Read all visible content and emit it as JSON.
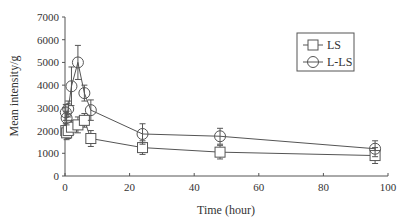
{
  "chart_data": {
    "type": "line",
    "title": "",
    "xlabel": "Time (hour)",
    "ylabel": "Mean intensity/g",
    "xlim": [
      0,
      100
    ],
    "ylim": [
      0,
      7000
    ],
    "xticks": [
      0,
      20,
      40,
      60,
      80,
      100
    ],
    "yticks": [
      0,
      1000,
      2000,
      3000,
      4000,
      5000,
      6000,
      7000
    ],
    "grid": false,
    "legend_position": "upper right",
    "series": [
      {
        "name": "LS",
        "marker": "square",
        "x": [
          0.25,
          0.5,
          1,
          2,
          4,
          6,
          8,
          24,
          48,
          96
        ],
        "values": [
          2000,
          1900,
          2000,
          2150,
          2250,
          2450,
          1650,
          1250,
          1050,
          900
        ],
        "errors": [
          300,
          300,
          350,
          300,
          350,
          300,
          350,
          300,
          300,
          350
        ]
      },
      {
        "name": "L-LS",
        "marker": "circle",
        "x": [
          0.25,
          0.5,
          1,
          2,
          4,
          6,
          8,
          24,
          48,
          96
        ],
        "values": [
          2800,
          2550,
          2950,
          3950,
          5000,
          3650,
          2900,
          1850,
          1750,
          1200
        ],
        "errors": [
          350,
          300,
          350,
          850,
          750,
          350,
          450,
          450,
          350,
          350
        ]
      }
    ]
  }
}
